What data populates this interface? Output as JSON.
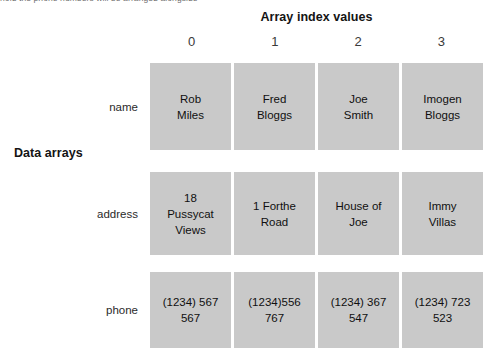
{
  "clipped_caption": "hold the phone numbers will be arranged alongside",
  "headers": {
    "columns_title": "Array index values",
    "rows_title": "Data arrays"
  },
  "index_values": [
    "0",
    "1",
    "2",
    "3"
  ],
  "row_labels": {
    "name": "name",
    "address": "address",
    "phone": "phone"
  },
  "rows": {
    "name": [
      "Rob\nMiles",
      "Fred\nBloggs",
      "Joe\nSmith",
      "Imogen\nBloggs"
    ],
    "address": [
      "18\nPussycat\nViews",
      "1 Forthe\nRoad",
      "House of\nJoe",
      "Immy\nVillas"
    ],
    "phone": [
      "(1234) 567\n567",
      "(1234)556\n767",
      "(1234) 367\n547",
      "(1234) 723\n523"
    ]
  },
  "colors": {
    "cell_fill": "#c9c9c9",
    "page_background": "#ffffff",
    "text": "#101010"
  }
}
